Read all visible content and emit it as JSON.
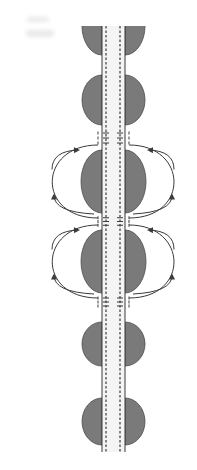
{
  "diagram": {
    "colors": {
      "background": "#ffffff",
      "myelin_fill": "#7a7a7a",
      "myelin_stroke": "#4a4a4a",
      "axon_line": "#3a3a3a",
      "axon_fill": "#f4f4f4",
      "current_loop": "#3a3a3a",
      "smudge": "#e9e9e9"
    },
    "axon": {
      "outer_left_x": 102,
      "outer_right_x": 125,
      "dashed_left_x": 106,
      "dashed_right_x": 120,
      "top_y": 26,
      "bottom_y": 452
    },
    "myelin_segments": [
      {
        "id": "segment-0",
        "top": 26,
        "bottom": 55,
        "half_width": 20,
        "clipped_top": true
      },
      {
        "id": "segment-1",
        "top": 75,
        "bottom": 125,
        "half_width": 20,
        "clipped_top": false
      },
      {
        "id": "segment-2",
        "top": 150,
        "bottom": 213,
        "half_width": 21,
        "clipped_top": false
      },
      {
        "id": "segment-3",
        "top": 230,
        "bottom": 293,
        "half_width": 21,
        "clipped_top": false
      },
      {
        "id": "segment-4",
        "top": 322,
        "bottom": 366,
        "half_width": 20,
        "clipped_top": false
      },
      {
        "id": "segment-5",
        "top": 398,
        "bottom": 445,
        "half_width": 20,
        "clipped_top": false
      }
    ],
    "nodes_of_ranvier": [
      {
        "id": "node-1",
        "top": 128,
        "bottom": 148,
        "charges": [
          "+",
          "+",
          "+"
        ]
      },
      {
        "id": "node-2",
        "top": 214,
        "bottom": 229,
        "charges": [
          "+",
          "+",
          "+"
        ]
      },
      {
        "id": "node-3",
        "top": 294,
        "bottom": 310,
        "charges": [
          "+",
          "+",
          "+"
        ]
      }
    ],
    "current_loops": [
      {
        "id": "loop-upper-left",
        "side": "left",
        "top_y": 145,
        "bottom_y": 218,
        "extent_x": 48
      },
      {
        "id": "loop-upper-right",
        "side": "right",
        "top_y": 145,
        "bottom_y": 218,
        "extent_x": 178
      },
      {
        "id": "loop-lower-left",
        "side": "left",
        "top_y": 225,
        "bottom_y": 298,
        "extent_x": 48
      },
      {
        "id": "loop-lower-right",
        "side": "right",
        "top_y": 225,
        "bottom_y": 298,
        "extent_x": 178
      }
    ],
    "labels": []
  }
}
